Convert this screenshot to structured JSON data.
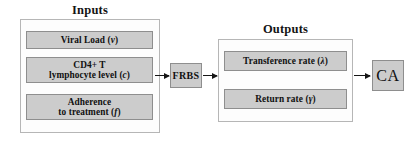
{
  "diagram": {
    "width": 419,
    "height": 150,
    "colors": {
      "node_fill": "#cccccc",
      "node_border": "#8e8e8e",
      "group_border": "#b6b6b6",
      "arrow": "#161616",
      "text": "#101010",
      "background": "#ffffff"
    }
  },
  "groups": {
    "inputs": {
      "title": "Inputs",
      "nodes": [
        {
          "id": "viral-load",
          "text": "Viral Load",
          "variable": "v"
        },
        {
          "id": "cd4-t-lymphocyte-level",
          "line1": "CD4+ T",
          "line2": "lymphocyte level",
          "variable": "c"
        },
        {
          "id": "adherence-to-treatment",
          "line1": "Adherence",
          "line2": "to treatment",
          "variable": "f"
        }
      ]
    },
    "outputs": {
      "title": "Outputs",
      "nodes": [
        {
          "id": "transference-rate",
          "text": "Transference rate",
          "variable": "λ"
        },
        {
          "id": "return-rate",
          "text": "Return rate",
          "variable": "γ"
        }
      ]
    }
  },
  "processors": {
    "frbs": {
      "label": "FRBS"
    },
    "ca": {
      "label": "CA"
    }
  },
  "arrows": [
    {
      "id": "inputs-to-frbs",
      "from": "inputs",
      "to": "frbs"
    },
    {
      "id": "frbs-to-outputs",
      "from": "frbs",
      "to": "outputs"
    },
    {
      "id": "outputs-to-ca",
      "from": "outputs",
      "to": "ca"
    }
  ]
}
